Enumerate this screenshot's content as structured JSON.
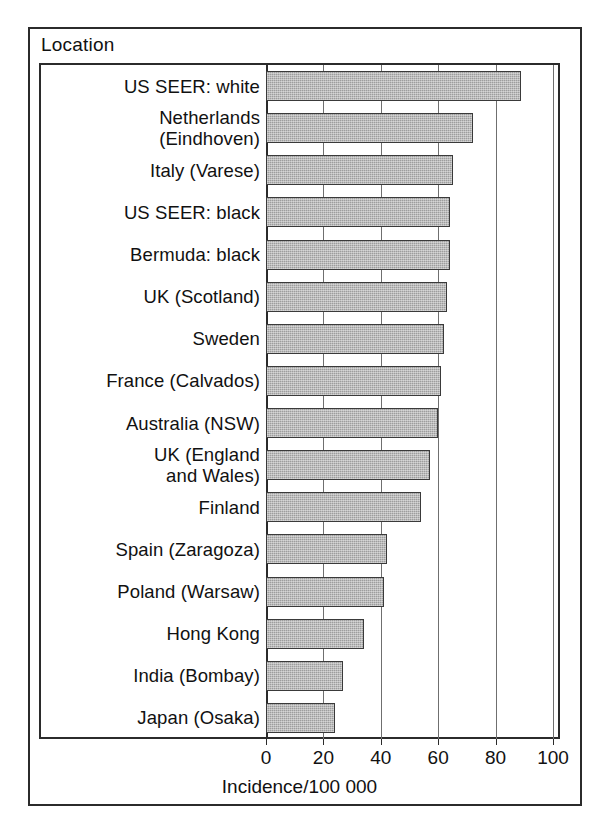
{
  "figure": {
    "axis_group_caption": "Location",
    "xaxis_title": "Incidence/100 000"
  },
  "chart_data": {
    "type": "bar",
    "orientation": "horizontal",
    "title": "",
    "subtitle": "",
    "xlabel": "Incidence/100 000",
    "ylabel": "Location",
    "xlim": [
      0,
      100
    ],
    "xticks": [
      0,
      20,
      40,
      60,
      80,
      100
    ],
    "xtick_labels": [
      "0",
      "20",
      "40",
      "60",
      "80",
      "100"
    ],
    "grid": "vertical",
    "legend": "none",
    "bar_fill_color": "#9d9d9d",
    "bar_edge_color": "#3a3a3a",
    "categories": [
      "US SEER: white",
      "Netherlands\n(Eindhoven)",
      "Italy (Varese)",
      "US SEER: black",
      "Bermuda: black",
      "UK (Scotland)",
      "Sweden",
      "France (Calvados)",
      "Australia (NSW)",
      "UK (England\nand Wales)",
      "Finland",
      "Spain (Zaragoza)",
      "Poland (Warsaw)",
      "Hong Kong",
      "India (Bombay)",
      "Japan (Osaka)"
    ],
    "values": [
      89,
      72,
      65,
      64,
      64,
      63,
      62,
      61,
      60,
      57,
      54,
      42,
      41,
      34,
      27,
      24
    ]
  }
}
